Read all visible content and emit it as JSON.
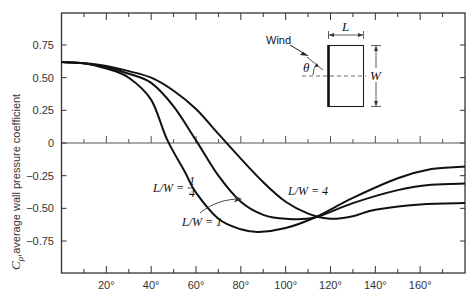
{
  "chart_data": {
    "type": "line",
    "title": "",
    "xlabel": "",
    "ylabel": "C_p, average wall pressure coefficient",
    "xlim": [
      0,
      180
    ],
    "ylim": [
      -0.96,
      0.99
    ],
    "x_ticks": [
      20,
      40,
      60,
      80,
      100,
      120,
      140,
      160
    ],
    "x_tick_labels": [
      "20°",
      "40°",
      "60°",
      "80°",
      "100°",
      "120°",
      "140°",
      "160°"
    ],
    "x_minor_ticks": [
      10,
      30,
      50,
      70,
      90,
      110,
      130,
      150,
      170
    ],
    "y_ticks": [
      0.75,
      0.5,
      0.25,
      0,
      -0.25,
      -0.5,
      -0.75
    ],
    "y_tick_labels": [
      "0.75",
      "0.50",
      "0.25",
      "0",
      "−0.25",
      "−0.50",
      "−0.75"
    ],
    "grid": false,
    "zero_line": true,
    "series": [
      {
        "name": "L/W = 1/4",
        "x": [
          0,
          10,
          20,
          30,
          40,
          47,
          55,
          60,
          70,
          80,
          88,
          100,
          113,
          130,
          150,
          165,
          180
        ],
        "values": [
          0.62,
          0.61,
          0.57,
          0.5,
          0.33,
          0.03,
          -0.22,
          -0.38,
          -0.58,
          -0.66,
          -0.68,
          -0.65,
          -0.57,
          -0.42,
          -0.27,
          -0.2,
          -0.18
        ]
      },
      {
        "name": "L/W = 1",
        "x": [
          0,
          10,
          20,
          30,
          40,
          50,
          60,
          70,
          80,
          90,
          100,
          113,
          130,
          150,
          165,
          180
        ],
        "values": [
          0.62,
          0.61,
          0.58,
          0.53,
          0.46,
          0.28,
          0.02,
          -0.25,
          -0.45,
          -0.55,
          -0.58,
          -0.57,
          -0.46,
          -0.36,
          -0.32,
          -0.31
        ]
      },
      {
        "name": "L/W = 4",
        "x": [
          0,
          10,
          20,
          30,
          40,
          50,
          60,
          70,
          80,
          90,
          100,
          110,
          120,
          130,
          140,
          160,
          180
        ],
        "values": [
          0.62,
          0.61,
          0.59,
          0.55,
          0.5,
          0.4,
          0.26,
          0.07,
          -0.12,
          -0.3,
          -0.45,
          -0.54,
          -0.58,
          -0.56,
          -0.51,
          -0.47,
          -0.46
        ]
      }
    ],
    "annotations": [
      {
        "text": "L/W = ",
        "frac": "1/4",
        "series": "L/W = 1/4"
      },
      {
        "text": "L/W = 1",
        "series": "L/W = 1",
        "arrow": true
      },
      {
        "text": "L/W = 4",
        "series": "L/W = 4"
      }
    ],
    "inset": {
      "wind_label": "Wind",
      "theta_label": "θ",
      "length_label": "L",
      "width_label": "W"
    }
  },
  "labels": {
    "ylabel_c": "C",
    "ylabel_p": "p",
    "ylabel_rest": ",average wall pressure coefficient",
    "quarter_prefix": "L/W =",
    "quarter_num": "1",
    "quarter_den": "4",
    "one": "L/W = 1",
    "four": "L/W = 4",
    "wind": "Wind",
    "theta": "θ",
    "L": "L",
    "W": "W"
  }
}
